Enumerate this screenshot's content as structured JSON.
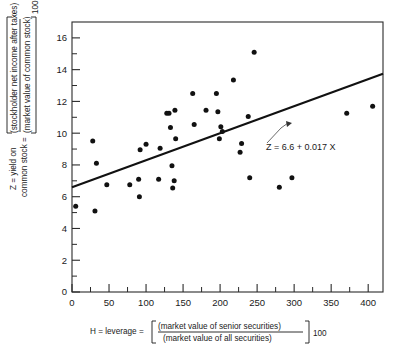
{
  "chart_data": {
    "type": "scatter",
    "title": "",
    "xlabel": "H = leverage = [(market value of senior securities) / (market value of all securities)] 100",
    "ylabel": "Z = yield on common stock = [(stockholder net income after taxes) / (market value of common stock)] 100",
    "xlim": [
      0,
      420
    ],
    "ylim": [
      0,
      17
    ],
    "xticks": [
      0,
      50,
      100,
      150,
      200,
      250,
      300,
      350,
      400
    ],
    "yticks": [
      0,
      2,
      4,
      6,
      8,
      10,
      12,
      14,
      16
    ],
    "minor_ticks": true,
    "grid": false,
    "legend": "none",
    "annotation": "Z = 6.6 + 0.017 X",
    "fit_line": {
      "intercept": 6.6,
      "slope": 0.017,
      "x_start": 0,
      "x_end": 420,
      "y_start": 6.6,
      "y_end": 13.74
    },
    "points": [
      {
        "x": 5,
        "y": 5.4
      },
      {
        "x": 28,
        "y": 9.5
      },
      {
        "x": 31,
        "y": 5.1
      },
      {
        "x": 33,
        "y": 8.1
      },
      {
        "x": 47,
        "y": 6.75
      },
      {
        "x": 78,
        "y": 6.75
      },
      {
        "x": 90,
        "y": 7.1
      },
      {
        "x": 91,
        "y": 6.0
      },
      {
        "x": 92,
        "y": 8.95
      },
      {
        "x": 100,
        "y": 9.3
      },
      {
        "x": 117,
        "y": 7.1
      },
      {
        "x": 119,
        "y": 9.05
      },
      {
        "x": 128,
        "y": 11.25
      },
      {
        "x": 131,
        "y": 11.25
      },
      {
        "x": 133,
        "y": 10.35
      },
      {
        "x": 135,
        "y": 7.95
      },
      {
        "x": 136,
        "y": 6.55
      },
      {
        "x": 138,
        "y": 7.0
      },
      {
        "x": 139,
        "y": 11.45
      },
      {
        "x": 140,
        "y": 9.65
      },
      {
        "x": 163,
        "y": 12.5
      },
      {
        "x": 165,
        "y": 10.55
      },
      {
        "x": 181,
        "y": 11.45
      },
      {
        "x": 195,
        "y": 12.5
      },
      {
        "x": 197,
        "y": 11.35
      },
      {
        "x": 199,
        "y": 9.65
      },
      {
        "x": 201,
        "y": 10.4
      },
      {
        "x": 203,
        "y": 10.1
      },
      {
        "x": 218,
        "y": 13.35
      },
      {
        "x": 227,
        "y": 8.8
      },
      {
        "x": 229,
        "y": 9.35
      },
      {
        "x": 238,
        "y": 11.05
      },
      {
        "x": 240,
        "y": 7.2
      },
      {
        "x": 246,
        "y": 15.1
      },
      {
        "x": 280,
        "y": 6.6
      },
      {
        "x": 297,
        "y": 7.2
      },
      {
        "x": 371,
        "y": 11.25
      },
      {
        "x": 406,
        "y": 11.7
      }
    ]
  },
  "ylabel_parts": {
    "prefix_line1": "Z = yield on",
    "prefix_line2": "common stock =",
    "numerator": "(stockholder net income after taxes)",
    "denominator": "(market value of common stock)",
    "multiplier": "100"
  },
  "xlabel_parts": {
    "prefix": "H = leverage =",
    "numerator": "(market value of senior securities)",
    "denominator": "(market value of all securities)",
    "multiplier": "100"
  },
  "annotation": {
    "text": "Z = 6.6 + 0.017 X"
  },
  "ticks": {
    "x": [
      "0",
      "50",
      "100",
      "150",
      "200",
      "250",
      "300",
      "350",
      "400"
    ],
    "y": [
      "0",
      "2",
      "4",
      "6",
      "8",
      "10",
      "12",
      "14",
      "16"
    ]
  },
  "colors": {
    "point": "#111111",
    "line": "#111111",
    "axis": "#2a2a2a",
    "background": "#ffffff"
  }
}
